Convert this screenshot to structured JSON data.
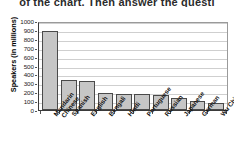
{
  "page": {
    "cut_off_header_text": "of the chart. Then answer the questi"
  },
  "chart_data": {
    "type": "bar",
    "title": "",
    "xlabel": "",
    "ylabel": "Speakers (in millions)",
    "ylim": [
      0,
      1000
    ],
    "ytick_labels": [
      "1000",
      "900",
      "800",
      "700",
      "600",
      "500",
      "400",
      "300",
      "200",
      "100",
      "0"
    ],
    "ytick_values": [
      1000,
      900,
      800,
      700,
      600,
      500,
      400,
      300,
      200,
      100,
      0
    ],
    "grid": true,
    "legend": false,
    "categories": [
      "Mandarin Chinese",
      "Spanish",
      "English",
      "Bengali",
      "Hindi",
      "Portuguese",
      "Russian",
      "Japanese",
      "German",
      "Wu Chinese"
    ],
    "category_lines": [
      [
        "Mandarin",
        "Chinese"
      ],
      [
        "Spanish"
      ],
      [
        "English"
      ],
      [
        "Bengali"
      ],
      [
        "Hindi"
      ],
      [
        "Portuguese"
      ],
      [
        "Russian"
      ],
      [
        "Japanese"
      ],
      [
        "German"
      ],
      [
        "Wu Chinese"
      ]
    ],
    "values": [
      890,
      335,
      325,
      195,
      185,
      175,
      170,
      130,
      105,
      80
    ],
    "bar_fill_color": "#c6c6c6",
    "bar_edge_color": "#4a4a4a",
    "gridline_color": "#cfcfcf",
    "axis_color": "#3a3a3a"
  }
}
